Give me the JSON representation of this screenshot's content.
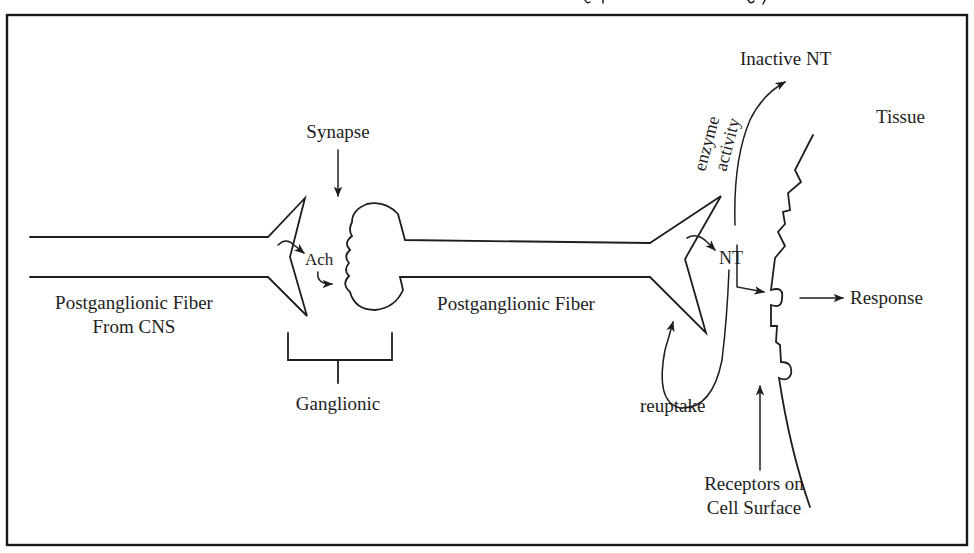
{
  "figure": {
    "type": "autonomic nervous system neurotransmission diagram",
    "labels": {
      "preganglionic_fiber_line1": "Postganglionic Fiber",
      "preganglionic_fiber_line2": "From CNS",
      "synapse": "Synapse",
      "ach": "Ach",
      "ganglionic": "Ganglionic",
      "postganglionic_fiber": "Postganglionic Fiber",
      "nt": "NT",
      "inactive_nt": "Inactive NT",
      "enzyme_line1": "enzyme",
      "enzyme_line2": "activity",
      "tissue": "Tissue",
      "response": "Response",
      "reuptake": "reuptake",
      "receptors_line1": "Receptors on",
      "receptors_line2": "Cell Surface"
    },
    "colors": {
      "ink": "#1e1e1e",
      "background": "#ffffff"
    }
  }
}
